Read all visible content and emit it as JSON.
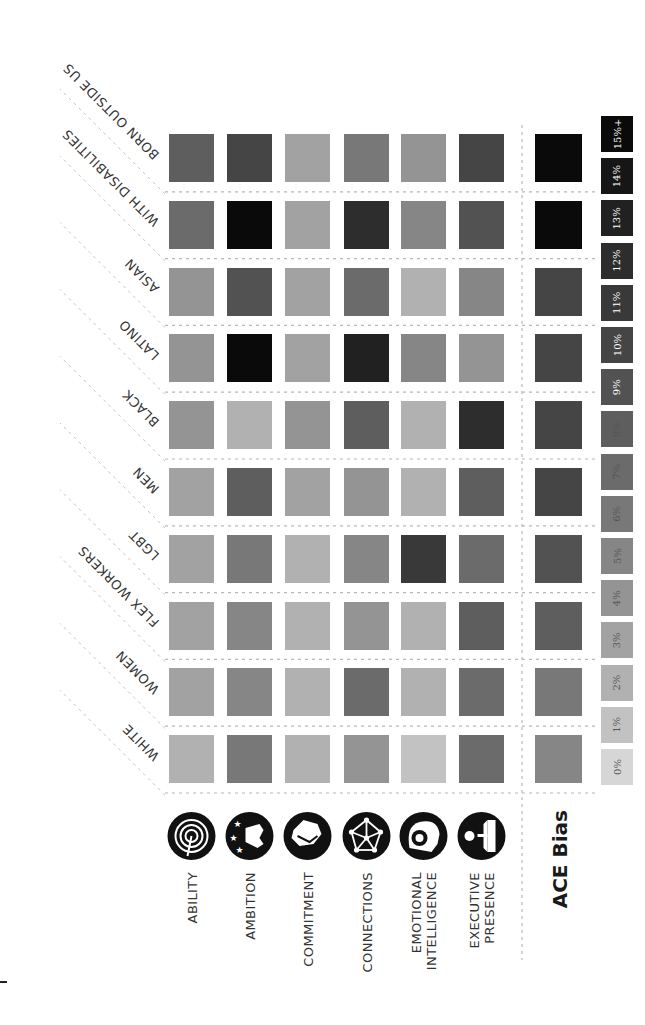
{
  "chart_data": {
    "type": "heatmap",
    "title": "",
    "orientation_note": "figure rotated 90 degrees on the page",
    "traits": [
      "ABILITY",
      "AMBITION",
      "COMMITMENT",
      "CONNECTIONS",
      "EMOTIONAL INTELLIGENCE",
      "EXECUTIVE PRESENCE"
    ],
    "trait_label_lines": [
      [
        "ABILITY"
      ],
      [
        "AMBITION"
      ],
      [
        "COMMITMENT"
      ],
      [
        "CONNECTIONS"
      ],
      [
        "EMOTIONAL",
        "INTELLIGENCE"
      ],
      [
        "EXECUTIVE",
        "PRESENCE"
      ]
    ],
    "trait_icons": [
      "target-icon",
      "hand-stars-icon",
      "handshake-icon",
      "network-icon",
      "head-heart-icon",
      "podium-speaker-icon"
    ],
    "summary_column_label": "ACE Bias",
    "groups": [
      "BORN OUTSIDE US",
      "WITH DISABILITIES",
      "ASIAN",
      "LATINO",
      "BLACK",
      "MEN",
      "LGBT",
      "FLEX WORKERS",
      "WOMEN",
      "WHITE"
    ],
    "values_percent": [
      [
        8,
        10,
        3,
        6,
        4,
        10
      ],
      [
        7,
        15,
        3,
        12,
        5,
        9
      ],
      [
        4,
        9,
        3,
        7,
        2,
        5
      ],
      [
        4,
        15,
        3,
        13,
        5,
        4
      ],
      [
        4,
        2,
        4,
        8,
        2,
        12
      ],
      [
        3,
        8,
        3,
        4,
        2,
        8
      ],
      [
        3,
        6,
        2,
        5,
        11,
        7
      ],
      [
        3,
        5,
        2,
        4,
        2,
        8
      ],
      [
        3,
        5,
        2,
        7,
        2,
        7
      ],
      [
        2,
        6,
        2,
        4,
        1,
        7
      ]
    ],
    "ace_bias_percent": [
      15,
      15,
      10,
      10,
      10,
      10,
      9,
      8,
      6,
      5
    ],
    "legend": {
      "labels": [
        "0%",
        "1%",
        "2%",
        "3%",
        "4%",
        "5%",
        "6%",
        "7%",
        "8%",
        "9%",
        "10%",
        "11%",
        "12%",
        "13%",
        "14%",
        "15%+"
      ],
      "min": 0,
      "max": 15,
      "placement": "right"
    },
    "colors": {
      "low": "#d6d6d6",
      "high": "#0a0a0a",
      "grid": "#b8b8b8",
      "icon": "#111111"
    }
  }
}
